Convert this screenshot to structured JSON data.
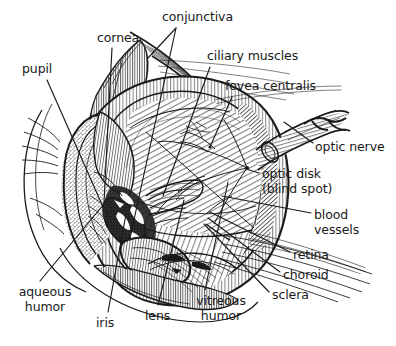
{
  "figure": {
    "style": "black-and-white pen-and-ink hatched line drawing",
    "background_color": "#ffffff",
    "ink_color": "#1a1a1a",
    "width": 396,
    "height": 346
  },
  "labels": [
    {
      "id": "pupil",
      "text": "pupil",
      "x": 22,
      "y": 62,
      "align": "left",
      "lines": [
        "pupil"
      ]
    },
    {
      "id": "cornea",
      "text": "cornea",
      "x": 97,
      "y": 31,
      "align": "left",
      "lines": [
        "cornea"
      ]
    },
    {
      "id": "conjunctiva",
      "text": "conjunctiva",
      "x": 162,
      "y": 10,
      "align": "left",
      "lines": [
        "conjunctiva"
      ]
    },
    {
      "id": "ciliary-muscles",
      "text": "ciliary muscles",
      "x": 207,
      "y": 49,
      "align": "left",
      "lines": [
        "ciliary muscles"
      ]
    },
    {
      "id": "fovea-centralis",
      "text": "fovea centralis",
      "x": 225,
      "y": 79,
      "align": "left",
      "lines": [
        "fovea centralis"
      ]
    },
    {
      "id": "optic-nerve",
      "text": "optic nerve",
      "x": 315,
      "y": 140,
      "align": "left",
      "lines": [
        "optic nerve"
      ]
    },
    {
      "id": "optic-disk",
      "text": "optic disk (blind spot)",
      "x": 262,
      "y": 167,
      "align": "left",
      "lines": [
        "optic disk",
        "(blind spot)"
      ]
    },
    {
      "id": "blood-vessels",
      "text": "blood vessels",
      "x": 314,
      "y": 208,
      "align": "left",
      "lines": [
        "blood",
        "vessels"
      ]
    },
    {
      "id": "retina",
      "text": "retina",
      "x": 293,
      "y": 248,
      "align": "left",
      "lines": [
        "retina"
      ]
    },
    {
      "id": "choroid",
      "text": "choroid",
      "x": 283,
      "y": 268,
      "align": "left",
      "lines": [
        "choroid"
      ]
    },
    {
      "id": "sclera",
      "text": "sclera",
      "x": 272,
      "y": 288,
      "align": "left",
      "lines": [
        "sclera"
      ]
    },
    {
      "id": "vitreous-humor",
      "text": "vitreous humor",
      "x": 191,
      "y": 294,
      "align": "left",
      "lines": [
        "vitreous",
        "humor"
      ]
    },
    {
      "id": "lens",
      "text": "lens",
      "x": 145,
      "y": 309,
      "align": "left",
      "lines": [
        "lens"
      ]
    },
    {
      "id": "iris",
      "text": "iris",
      "x": 96,
      "y": 316,
      "align": "left",
      "lines": [
        "iris"
      ]
    },
    {
      "id": "aqueous-humor",
      "text": "aqueous humor",
      "x": 12,
      "y": 285,
      "align": "left",
      "lines": [
        "aqueous",
        "humor"
      ]
    }
  ],
  "anatomy_parts": [
    "pupil",
    "cornea",
    "conjunctiva",
    "ciliary muscles",
    "fovea centralis",
    "optic nerve",
    "optic disk (blind spot)",
    "blood vessels",
    "retina",
    "choroid",
    "sclera",
    "vitreous humor",
    "lens",
    "iris",
    "aqueous humor"
  ]
}
